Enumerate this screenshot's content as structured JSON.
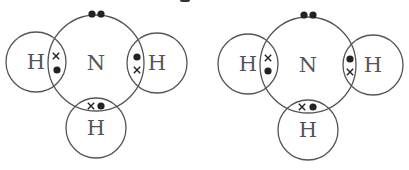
{
  "style": {
    "stroke_color": "#555555",
    "dot_color": "#222222",
    "label_color": "#555555",
    "stroke_width": 1.3
  },
  "diagrams": [
    {
      "id": "left",
      "central_atom": {
        "label": "N",
        "cx": 96,
        "cy": 63,
        "r": 48
      },
      "lone_pair": [
        {
          "cx": 92,
          "cy": 14
        },
        {
          "cx": 101,
          "cy": 14
        }
      ],
      "hydrogens": [
        {
          "label": "H",
          "position": "left",
          "cx": 36,
          "cy": 62,
          "r": 30,
          "electrons": [
            {
              "type": "cross",
              "x": 56,
              "y": 56
            },
            {
              "type": "dot",
              "x": 57,
              "y": 70
            }
          ]
        },
        {
          "label": "H",
          "position": "right",
          "cx": 157,
          "cy": 63,
          "r": 30,
          "electrons": [
            {
              "type": "dot",
              "x": 137,
              "y": 57
            },
            {
              "type": "cross",
              "x": 137,
              "y": 70
            }
          ]
        },
        {
          "label": "H",
          "position": "bottom",
          "cx": 96,
          "cy": 128,
          "r": 30,
          "electrons": [
            {
              "type": "cross",
              "x": 91,
              "y": 106
            },
            {
              "type": "dot",
              "x": 101,
              "y": 106
            }
          ]
        }
      ]
    },
    {
      "id": "right",
      "central_atom": {
        "label": "N",
        "cx": 308,
        "cy": 65,
        "r": 48
      },
      "lone_pair": [
        {
          "cx": 304,
          "cy": 15
        },
        {
          "cx": 313,
          "cy": 15
        }
      ],
      "hydrogens": [
        {
          "label": "H",
          "position": "left",
          "cx": 248,
          "cy": 64,
          "r": 30,
          "electrons": [
            {
              "type": "cross",
              "x": 268,
              "y": 58
            },
            {
              "type": "dot",
              "x": 268,
              "y": 71
            }
          ]
        },
        {
          "label": "H",
          "position": "right",
          "cx": 373,
          "cy": 65,
          "r": 30,
          "electrons": [
            {
              "type": "dot",
              "x": 350,
              "y": 59
            },
            {
              "type": "cross",
              "x": 350,
              "y": 72
            }
          ]
        },
        {
          "label": "H",
          "position": "bottom",
          "cx": 308,
          "cy": 130,
          "r": 30,
          "electrons": [
            {
              "type": "cross",
              "x": 302,
              "y": 107
            },
            {
              "type": "dot",
              "x": 313,
              "y": 107
            }
          ]
        }
      ]
    }
  ]
}
